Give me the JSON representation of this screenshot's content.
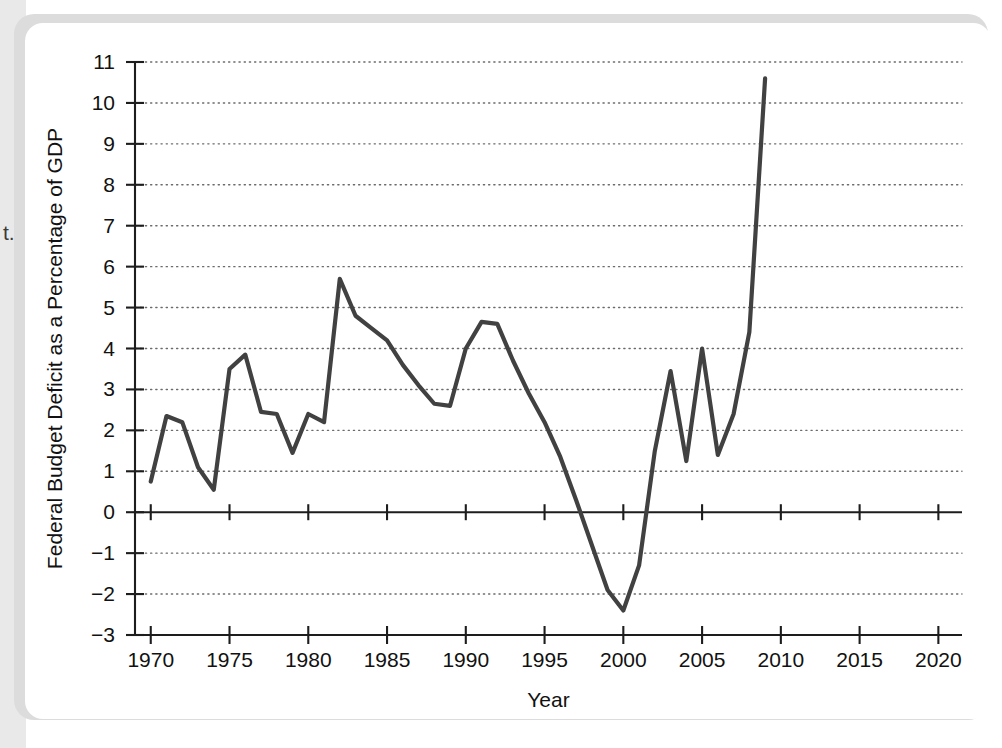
{
  "page": {
    "margin_text_fragment": "t."
  },
  "figure": {
    "axis": {
      "x_title": "Year",
      "y_title": "Federal Budget Deficit as a Percentage of GDP"
    },
    "colors": {
      "line": "#414141",
      "grid": "#6b6b6b",
      "axis": "#1d1d1d",
      "card": "#ffffff",
      "shadow": "#dcdcdc",
      "gutter": "#e9e9e9"
    }
  },
  "chart_data": {
    "type": "line",
    "title": "",
    "subtitle": "",
    "xlabel": "Year",
    "ylabel": "Federal Budget Deficit as a Percentage of GDP",
    "xlim": [
      1969,
      2021.5
    ],
    "ylim": [
      -3,
      11
    ],
    "grid": true,
    "grid_axis": "y",
    "legend": "none",
    "x_ticks": [
      1970,
      1975,
      1980,
      1985,
      1990,
      1995,
      2000,
      2005,
      2010,
      2015,
      2020
    ],
    "x_tick_labels": [
      "1970",
      "1975",
      "1980",
      "1985",
      "1990",
      "1995",
      "2000",
      "2005",
      "2010",
      "2015",
      "2020"
    ],
    "x_minor_ticks": [
      1970,
      1971,
      1972,
      1973,
      1974,
      1975,
      1976,
      1977,
      1978,
      1979,
      1980,
      1981,
      1982,
      1983,
      1984,
      1985,
      1986,
      1987,
      1988,
      1989,
      1990,
      1991,
      1992,
      1993,
      1994,
      1995,
      1996,
      1997,
      1998,
      1999,
      2000,
      2001,
      2002,
      2003,
      2004,
      2005,
      2006,
      2007,
      2008,
      2009,
      2010,
      2011,
      2012,
      2013,
      2014,
      2015,
      2016,
      2017,
      2018,
      2019,
      2020
    ],
    "y_ticks": [
      -3,
      -2,
      -1,
      0,
      1,
      2,
      3,
      4,
      5,
      6,
      7,
      8,
      9,
      10,
      11
    ],
    "y_tick_labels": [
      "−3",
      "−2",
      "−1",
      "0",
      "1",
      "2",
      "3",
      "4",
      "5",
      "6",
      "7",
      "8",
      "9",
      "10",
      "11"
    ],
    "zero_line": 0,
    "x": [
      1970,
      1971,
      1972,
      1973,
      1974,
      1975,
      1976,
      1977,
      1978,
      1979,
      1980,
      1981,
      1982,
      1983,
      1984,
      1985,
      1986,
      1987,
      1988,
      1989,
      1990,
      1991,
      1992,
      1993,
      1994,
      1995,
      1996,
      1997,
      1998,
      1999,
      2000,
      2001,
      2002,
      2003,
      2004,
      2005,
      2006,
      2007,
      2008,
      2009
    ],
    "values": [
      0.75,
      2.35,
      2.2,
      1.1,
      0.55,
      3.5,
      3.85,
      2.45,
      2.4,
      1.45,
      2.4,
      2.2,
      5.7,
      4.8,
      4.5,
      4.2,
      3.6,
      3.1,
      2.65,
      2.6,
      4.0,
      4.65,
      4.6,
      3.7,
      2.9,
      2.2,
      1.35,
      0.3,
      -0.8,
      -1.9,
      -2.4,
      -1.3,
      1.5,
      3.45,
      1.25,
      4.0,
      1.4,
      2.4,
      4.4,
      10.6
    ],
    "series": [
      {
        "name": "Federal Budget Deficit as a Percentage of GDP",
        "values": [
          0.75,
          2.35,
          2.2,
          1.1,
          0.55,
          3.5,
          3.85,
          2.45,
          2.4,
          1.45,
          2.4,
          2.2,
          5.7,
          4.8,
          4.5,
          4.2,
          3.6,
          3.1,
          2.65,
          2.6,
          4.0,
          4.65,
          4.6,
          3.7,
          2.9,
          2.2,
          1.35,
          0.3,
          -0.8,
          -1.9,
          -2.4,
          -1.3,
          1.5,
          3.45,
          1.25,
          4.0,
          1.4,
          2.4,
          4.4,
          10.6
        ]
      }
    ]
  }
}
